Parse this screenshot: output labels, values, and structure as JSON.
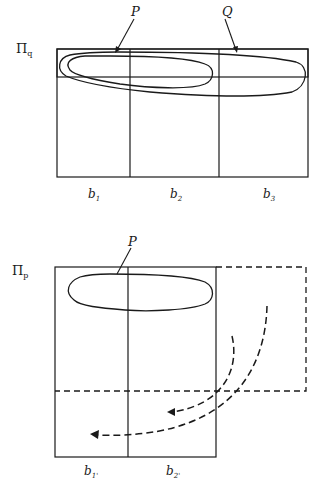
{
  "top_panel": {
    "space_label": "Π",
    "space_subscript": "q",
    "curve_labels": {
      "P": "P",
      "Q": "Q"
    },
    "blocks": [
      {
        "label": "b",
        "sub": "1"
      },
      {
        "label": "b",
        "sub": "2"
      },
      {
        "label": "b",
        "sub": "3"
      }
    ]
  },
  "bottom_panel": {
    "space_label": "Π",
    "space_subscript": "p",
    "curve_labels": {
      "P": "P"
    },
    "blocks": [
      {
        "label": "b",
        "sub": "1'"
      },
      {
        "label": "b",
        "sub": "2'"
      }
    ]
  },
  "colors": {
    "stroke": "#1a1a1a",
    "background": "#ffffff"
  }
}
